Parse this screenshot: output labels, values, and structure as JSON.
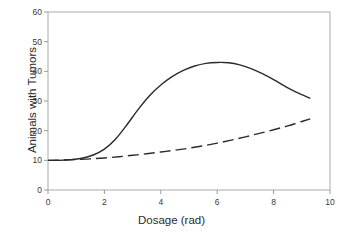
{
  "chart_data": {
    "type": "line",
    "title": "",
    "xlabel": "Dosage (rad)",
    "ylabel": "Animals with Tumors",
    "xlim": [
      0,
      10
    ],
    "ylim": [
      0,
      60
    ],
    "xticks": [
      0,
      2,
      4,
      6,
      8,
      10
    ],
    "xtick_labels": [
      "0",
      "2",
      "4",
      "6",
      "8",
      "10"
    ],
    "yticks": [
      0,
      10,
      20,
      30,
      40,
      50,
      60
    ],
    "ytick_labels": [
      "0",
      "10",
      "20",
      "30",
      "40",
      "50",
      "60"
    ],
    "grid": false,
    "legend": "none",
    "line_color": "#2b2b2b",
    "frame_color": "#aaaaaa",
    "background": "#ffffff",
    "series": [
      {
        "name": "solid-curve",
        "style": "solid",
        "color": "#2b2b2b",
        "x": [
          0.0,
          0.4,
          0.8,
          1.2,
          1.6,
          2.0,
          2.4,
          2.8,
          3.2,
          3.6,
          4.0,
          4.4,
          4.8,
          5.2,
          5.6,
          6.0,
          6.4,
          6.8,
          7.2,
          7.6,
          8.0,
          8.4,
          8.8,
          9.3
        ],
        "y": [
          10.0,
          10.0,
          10.2,
          10.7,
          11.8,
          13.8,
          17.2,
          22.0,
          27.2,
          31.8,
          35.4,
          38.2,
          40.3,
          41.8,
          42.7,
          43.0,
          42.9,
          42.2,
          40.9,
          39.2,
          37.2,
          35.0,
          33.0,
          30.9
        ]
      },
      {
        "name": "dashed-curve",
        "style": "dashed",
        "color": "#2b2b2b",
        "dash_pattern": "11,5",
        "x": [
          0.0,
          0.5,
          1.0,
          1.5,
          2.0,
          2.5,
          3.0,
          3.5,
          4.0,
          4.5,
          5.0,
          5.5,
          6.0,
          6.5,
          7.0,
          7.5,
          8.0,
          8.5,
          9.0,
          9.3
        ],
        "y": [
          10.0,
          10.1,
          10.3,
          10.5,
          10.8,
          11.2,
          11.7,
          12.2,
          12.8,
          13.4,
          14.1,
          14.9,
          15.8,
          16.8,
          17.9,
          19.1,
          20.3,
          21.6,
          23.1,
          24.0
        ]
      }
    ],
    "annotations": {
      "peak_value": 43,
      "peak_dosage": 6,
      "baseline_value": 10
    }
  }
}
